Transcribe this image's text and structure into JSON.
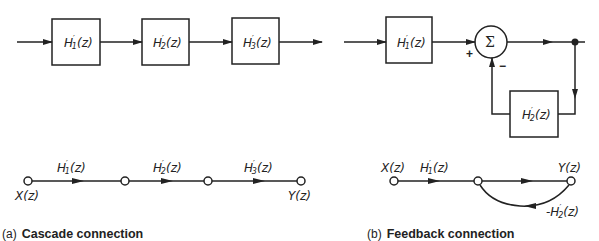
{
  "cascade": {
    "blocks": [
      {
        "label": "H'1(z)",
        "base": "H",
        "sub": "1",
        "arg": "(z)"
      },
      {
        "label": "H'2(z)",
        "base": "H",
        "sub": "2",
        "arg": "(z)"
      },
      {
        "label": "H'3(z)",
        "base": "H",
        "sub": "3",
        "arg": "(z)"
      }
    ],
    "flowgraph": {
      "input_label": "X(z)",
      "output_label": "Y(z)",
      "branches": [
        {
          "label": "H'1(z)",
          "base": "H",
          "sub": "1",
          "arg": "(z)"
        },
        {
          "label": "H'2(z)",
          "base": "H",
          "sub": "2",
          "arg": "(z)"
        },
        {
          "label": "H'3(z)",
          "base": "H",
          "sub": "3",
          "arg": "(z)"
        }
      ]
    },
    "caption_prefix": "(a)",
    "caption_title": "Cascade connection"
  },
  "feedback": {
    "forward_block": {
      "label": "H'1(z)",
      "base": "H",
      "sub": "1",
      "arg": "(z)"
    },
    "feedback_block": {
      "label": "H'2(z)",
      "base": "H",
      "sub": "2",
      "arg": "(z)"
    },
    "summer_symbol": "Σ",
    "plus_sign": "+",
    "minus_sign": "−",
    "flowgraph": {
      "input_label": "X(z)",
      "output_label": "Y(z)",
      "forward_branch": {
        "label": "H'1(z)",
        "base": "H",
        "sub": "1",
        "arg": "(z)"
      },
      "feedback_branch": {
        "label": "-H'2(z)",
        "prefix": "-",
        "base": "H",
        "sub": "2",
        "arg": "(z)"
      }
    },
    "caption_prefix": "(b)",
    "caption_title": "Feedback connection"
  }
}
